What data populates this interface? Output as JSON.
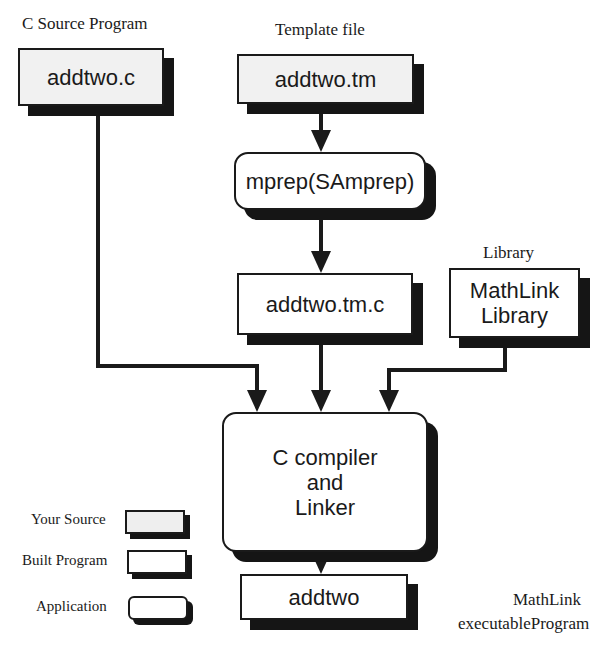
{
  "diagram": {
    "section_labels": {
      "c_source": "C Source Program",
      "template": "Template file",
      "library": "Library",
      "output_line1": "MathLink",
      "output_line2": "executableProgram"
    },
    "nodes": {
      "addtwo_c": {
        "label": "addtwo.c",
        "kind": "your-source"
      },
      "addtwo_tm": {
        "label": "addtwo.tm",
        "kind": "your-source"
      },
      "mprep": {
        "label": "mprep(SAmprep)",
        "kind": "application"
      },
      "addtwo_tm_c": {
        "label": "addtwo.tm.c",
        "kind": "built-program"
      },
      "mathlink_library": {
        "label_line1": "MathLink",
        "label_line2": "Library",
        "kind": "built-program"
      },
      "compiler": {
        "label_line1": "C compiler",
        "label_line2": "and",
        "label_line3": "Linker",
        "kind": "application"
      },
      "addtwo": {
        "label": "addtwo",
        "kind": "built-program"
      }
    },
    "edges": [
      {
        "from": "addtwo_tm",
        "to": "mprep"
      },
      {
        "from": "mprep",
        "to": "addtwo_tm_c"
      },
      {
        "from": "addtwo_c",
        "to": "compiler"
      },
      {
        "from": "addtwo_tm_c",
        "to": "compiler"
      },
      {
        "from": "mathlink_library",
        "to": "compiler"
      },
      {
        "from": "compiler",
        "to": "addtwo"
      }
    ],
    "legend": [
      {
        "label": "Your Source",
        "kind": "your-source"
      },
      {
        "label": "Built Program",
        "kind": "built-program"
      },
      {
        "label": "Application",
        "kind": "application"
      }
    ],
    "colors": {
      "ink": "#1a1a1a",
      "shadow": "#151515",
      "source_fill": "#f1f1f1",
      "background": "#ffffff"
    }
  }
}
